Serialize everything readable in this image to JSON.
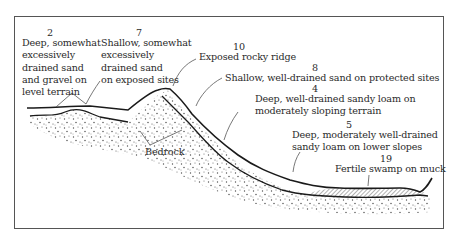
{
  "diagram": {
    "type": "soil-landscape cross-section",
    "annotations": [
      {
        "id": "2",
        "number": "2",
        "lines": [
          "Deep, somewhat",
          "excessively",
          "drained sand",
          "and gravel on",
          "level terrain"
        ]
      },
      {
        "id": "7",
        "number": "7",
        "lines": [
          "Shallow, somewhat",
          "excessively",
          "drained sand",
          "on exposed sites"
        ]
      },
      {
        "id": "10",
        "number": "10",
        "lines": [
          "Exposed rocky ridge"
        ]
      },
      {
        "id": "8",
        "number": "8",
        "lines": [
          "Shallow, well-drained sand on protected sites"
        ]
      },
      {
        "id": "4",
        "number": "4",
        "lines": [
          "Deep, well-drained sandy loam on",
          "moderately sloping terrain"
        ]
      },
      {
        "id": "5",
        "number": "5",
        "lines": [
          "Deep, moderately well-drained",
          "sandy loam on lower slopes"
        ]
      },
      {
        "id": "19",
        "number": "19",
        "lines": [
          "Fertile swamp on muck"
        ]
      }
    ],
    "bedrock_label": "Bedrock",
    "colors": {
      "line": "#1a1a1a",
      "stipple": "#333333",
      "hatch": "#555555",
      "frame": "#555555",
      "background": "#ffffff"
    }
  }
}
